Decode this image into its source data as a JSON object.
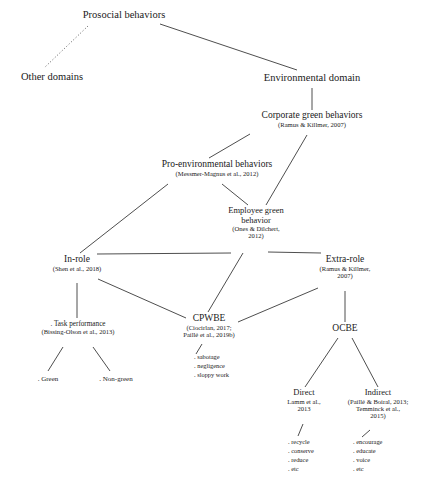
{
  "diagram": {
    "nodes": {
      "prosocial": {
        "label": "Prosocial behaviors",
        "cite": ""
      },
      "other_domains": {
        "label": "Other domains",
        "cite": ""
      },
      "environmental_domain": {
        "label": "Environmental domain",
        "cite": ""
      },
      "corporate_green": {
        "label": "Corporate green behaviors",
        "cite": "(Ramus & Killmer, 2007)"
      },
      "pro_environmental": {
        "label": "Pro-environmental behaviors",
        "cite": "(Messmer-Magnus et al., 2012)"
      },
      "employee_green": {
        "label_line1": "Employee green",
        "label_line2": "behavior",
        "cite_line1": "(Ones & Dilchert,",
        "cite_line2": "2012)"
      },
      "in_role": {
        "label": "In-role",
        "cite": "(Shen et al., 2018)"
      },
      "extra_role": {
        "label": "Extra-role",
        "cite_line1": "(Ramus & Killmer,",
        "cite_line2": "2007)"
      },
      "cpwbe": {
        "label": "CPWBE",
        "cite_line1": "(Ciocirlan, 2017;",
        "cite_line2": "Paillé et al., 2019b)"
      },
      "ocbe": {
        "label": "OCBE",
        "cite": ""
      },
      "task_performance": {
        "label": ". Task performance",
        "cite": "(Bissing-Olson et al., 2013)"
      },
      "direct": {
        "label": "Direct",
        "cite_line1": "Lamm et al.,",
        "cite_line2": "2013"
      },
      "indirect": {
        "label": "Indirect",
        "cite_line1": "(Paillé & Boiral, 2013;",
        "cite_line2": "Temminck et al.,",
        "cite_line3": "2015)"
      }
    },
    "leaf_groups": {
      "task_children": {
        "green": ". Green",
        "non_green": ". Non-green"
      },
      "cpwbe_examples": {
        "i0": ". sabotage",
        "i1": ". negligence",
        "i2": ". sloppy work"
      },
      "direct_examples": {
        "i0": ". recycle",
        "i1": ". conserve",
        "i2": ". reduce",
        "i3": ". etc"
      },
      "indirect_examples": {
        "i0": ". encourage",
        "i1": ". educate",
        "i2": ". voice",
        "i3": ". etc"
      }
    },
    "style": {
      "line_color": "#3a3a3a",
      "text_color": "#1a1a1a",
      "background": "#ffffff"
    }
  }
}
